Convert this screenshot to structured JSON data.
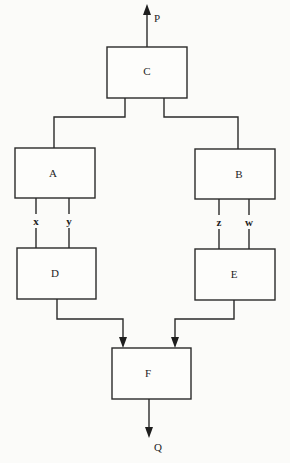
{
  "diagram": {
    "type": "block-diagram",
    "blocks": [
      {
        "id": "C",
        "label": "C"
      },
      {
        "id": "A",
        "label": "A"
      },
      {
        "id": "B",
        "label": "B"
      },
      {
        "id": "D",
        "label": "D"
      },
      {
        "id": "E",
        "label": "E"
      },
      {
        "id": "F",
        "label": "F"
      }
    ],
    "signals": {
      "P": "P",
      "Q": "Q",
      "x": "x",
      "y": "y",
      "z": "z",
      "w": "w"
    },
    "connections": [
      {
        "from": "C",
        "to": "output",
        "label": "P",
        "arrow": true
      },
      {
        "from": "C",
        "to": "A",
        "arrow": false
      },
      {
        "from": "C",
        "to": "B",
        "arrow": false
      },
      {
        "from": "A",
        "to": "D",
        "label": "x",
        "arrow": false
      },
      {
        "from": "A",
        "to": "D",
        "label": "y",
        "arrow": false
      },
      {
        "from": "B",
        "to": "E",
        "label": "z",
        "arrow": false
      },
      {
        "from": "B",
        "to": "E",
        "label": "w",
        "arrow": false
      },
      {
        "from": "D",
        "to": "F",
        "arrow": true
      },
      {
        "from": "E",
        "to": "F",
        "arrow": true
      },
      {
        "from": "F",
        "to": "output",
        "label": "Q",
        "arrow": true
      }
    ]
  }
}
